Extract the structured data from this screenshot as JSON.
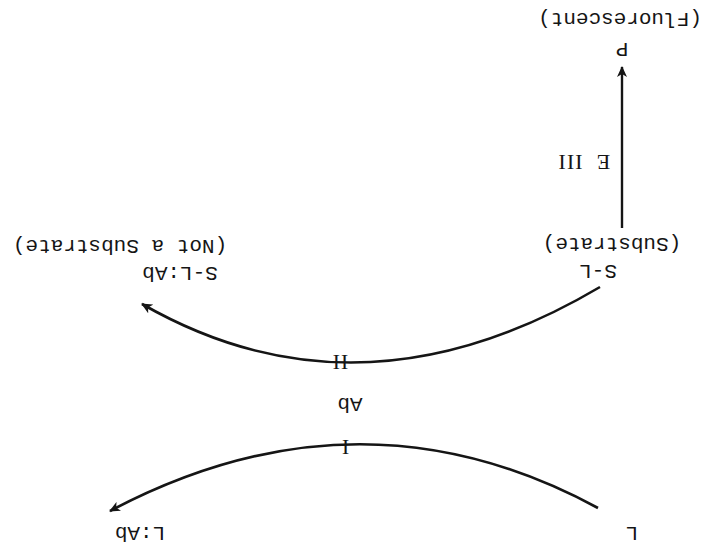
{
  "diagram": {
    "orientation": "rotated 180 degrees",
    "colors": {
      "ink": "#151515",
      "background": "#ffffff"
    },
    "nodes": {
      "L": {
        "label": "L"
      },
      "L_Ab": {
        "label": "L:Ab"
      },
      "Ab": {
        "label": "Ab"
      },
      "S_L": {
        "label": "S-L",
        "note": "(Substrate)"
      },
      "S_L_Ab": {
        "label": "S-L:Ab",
        "note": "(Not a Substrate)"
      },
      "P": {
        "label": "P",
        "note": "(Fluorescent)"
      }
    },
    "reactions": {
      "I": {
        "label": "I",
        "from": "L",
        "to": "L:Ab"
      },
      "II": {
        "label": "II",
        "from": "S-L",
        "to": "S-L:Ab"
      },
      "III": {
        "label": "III",
        "enzyme": "E",
        "from": "S-L",
        "to": "P"
      }
    }
  }
}
